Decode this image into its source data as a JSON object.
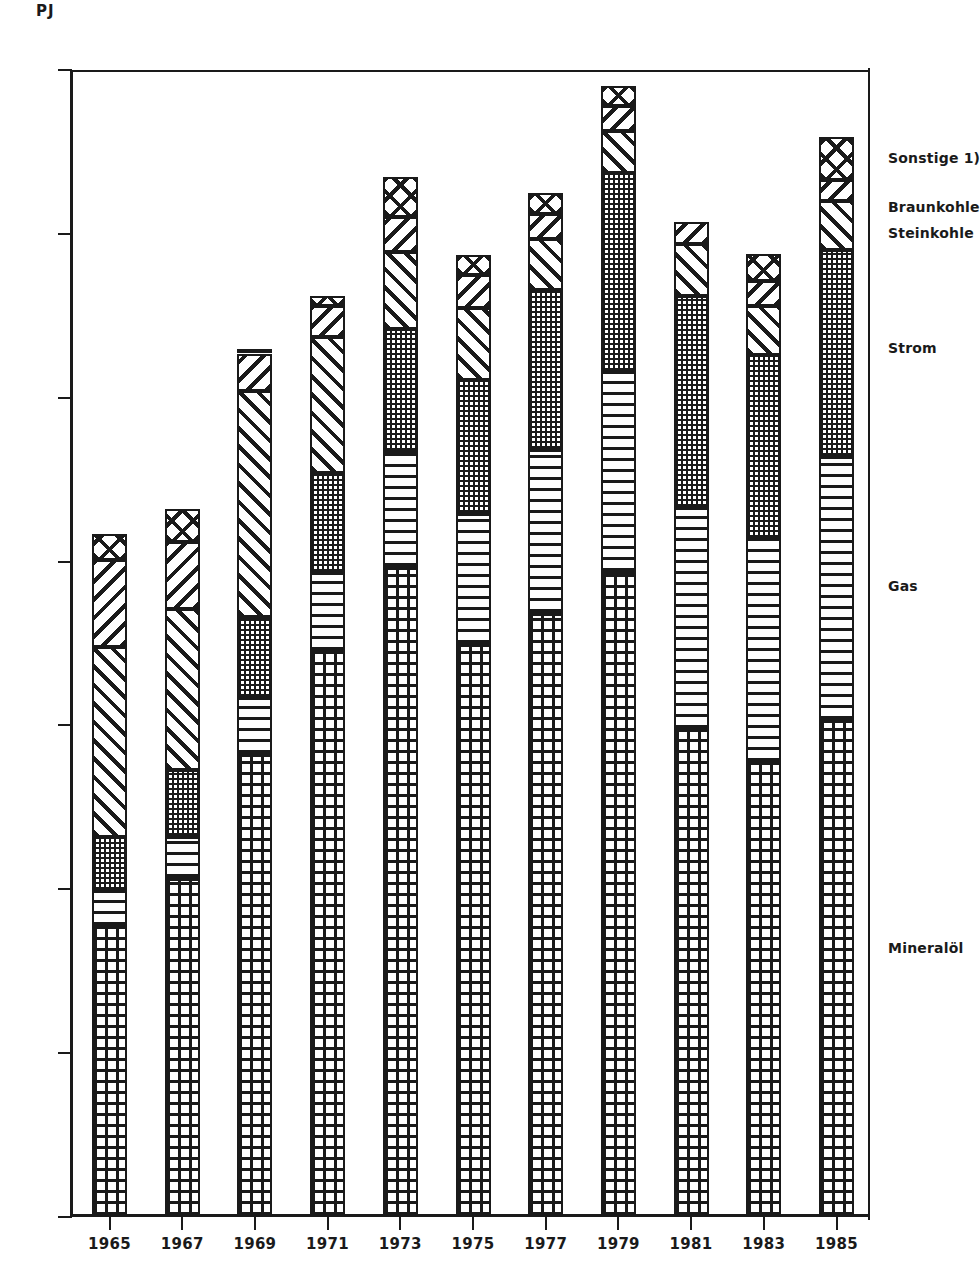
{
  "chart_data": {
    "type": "bar",
    "subtype": "stacked-vertical",
    "title": "",
    "xlabel": "",
    "ylabel": "PJ",
    "unit_label": "PJ",
    "ylim": [
      0,
      3500
    ],
    "ytick_values": [
      0,
      500,
      1000,
      1500,
      2000,
      2500,
      3000,
      3500
    ],
    "ytick_labels": [
      "0",
      "500",
      "1000",
      "1500",
      "2000",
      "2500",
      "3000",
      "3500"
    ],
    "grid": false,
    "legend_position": "right",
    "categories": [
      "1965",
      "1967",
      "1969",
      "1971",
      "1973",
      "1975",
      "1977",
      "1979",
      "1981",
      "1983",
      "1985"
    ],
    "series": [
      {
        "name": "Mineralöl",
        "pattern": "grid",
        "stack_order": 0,
        "values": [
          885,
          1030,
          1410,
          1725,
          1980,
          1745,
          1840,
          1965,
          1485,
          1385,
          1515
        ]
      },
      {
        "name": "Gas",
        "pattern": "horizontal-lines",
        "stack_order": 1,
        "values": [
          110,
          130,
          175,
          240,
          355,
          400,
          500,
          615,
          680,
          685,
          805
        ]
      },
      {
        "name": "Strom",
        "pattern": "dots",
        "stack_order": 2,
        "values": [
          165,
          205,
          245,
          305,
          375,
          410,
          490,
          605,
          645,
          560,
          630
        ]
      },
      {
        "name": "Steinkohle",
        "pattern": "forward-hatch",
        "stack_order": 3,
        "values": [
          580,
          490,
          690,
          415,
          235,
          220,
          155,
          130,
          160,
          150,
          150
        ]
      },
      {
        "name": "Braunkohle",
        "pattern": "back-hatch",
        "stack_order": 4,
        "values": [
          265,
          205,
          115,
          95,
          105,
          100,
          75,
          75,
          65,
          75,
          65
        ]
      },
      {
        "name": "Sonstige 1)",
        "pattern": "cross-hatch",
        "stack_order": 5,
        "values": [
          80,
          100,
          10,
          30,
          125,
          60,
          65,
          60,
          0,
          85,
          130
        ]
      }
    ],
    "totals": [
      2085,
      2160,
      2645,
      2810,
      3175,
      2935,
      3125,
      3450,
      3035,
      2940,
      3295
    ]
  },
  "legend": {
    "entries": [
      {
        "label": "Sonstige 1)",
        "top_px": 150
      },
      {
        "label": "Braunkohle",
        "top_px": 199
      },
      {
        "label": "Steinkohle",
        "top_px": 225
      },
      {
        "label": "Strom",
        "top_px": 340
      },
      {
        "label": "Gas",
        "top_px": 578
      },
      {
        "label": "Mineralöl",
        "top_px": 940
      }
    ]
  },
  "axes": {
    "unit": "PJ"
  }
}
